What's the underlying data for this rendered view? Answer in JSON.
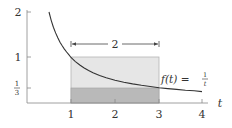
{
  "figure": {
    "type": "diagram",
    "axes": {
      "x_label": "t",
      "x_ticks": [
        "1",
        "2",
        "3",
        "4"
      ],
      "y_ticks": [
        "2",
        "1",
        "1/3"
      ],
      "y_tick_frac_num": "1",
      "y_tick_frac_den": "3"
    },
    "curve": {
      "label_prefix": "f(t) = ",
      "label_num": "1",
      "label_den": "t"
    },
    "width_marker": {
      "label": "2",
      "from": 1,
      "to": 3
    },
    "rectangles": [
      {
        "name": "upper-rectangle",
        "x0": 1,
        "x1": 3,
        "y0": 0,
        "y1": 1,
        "fill": "#e6e6e6"
      },
      {
        "name": "lower-rectangle",
        "x0": 1,
        "x1": 3,
        "y0": 0,
        "y1": 0.3333,
        "fill": "#b9b9b9"
      }
    ],
    "colors": {
      "axis": "#888888",
      "curve": "#333333",
      "rect_light": "#e6e6e6",
      "rect_dark": "#b9b9b9",
      "rect_border": "#b0b0b0"
    }
  }
}
